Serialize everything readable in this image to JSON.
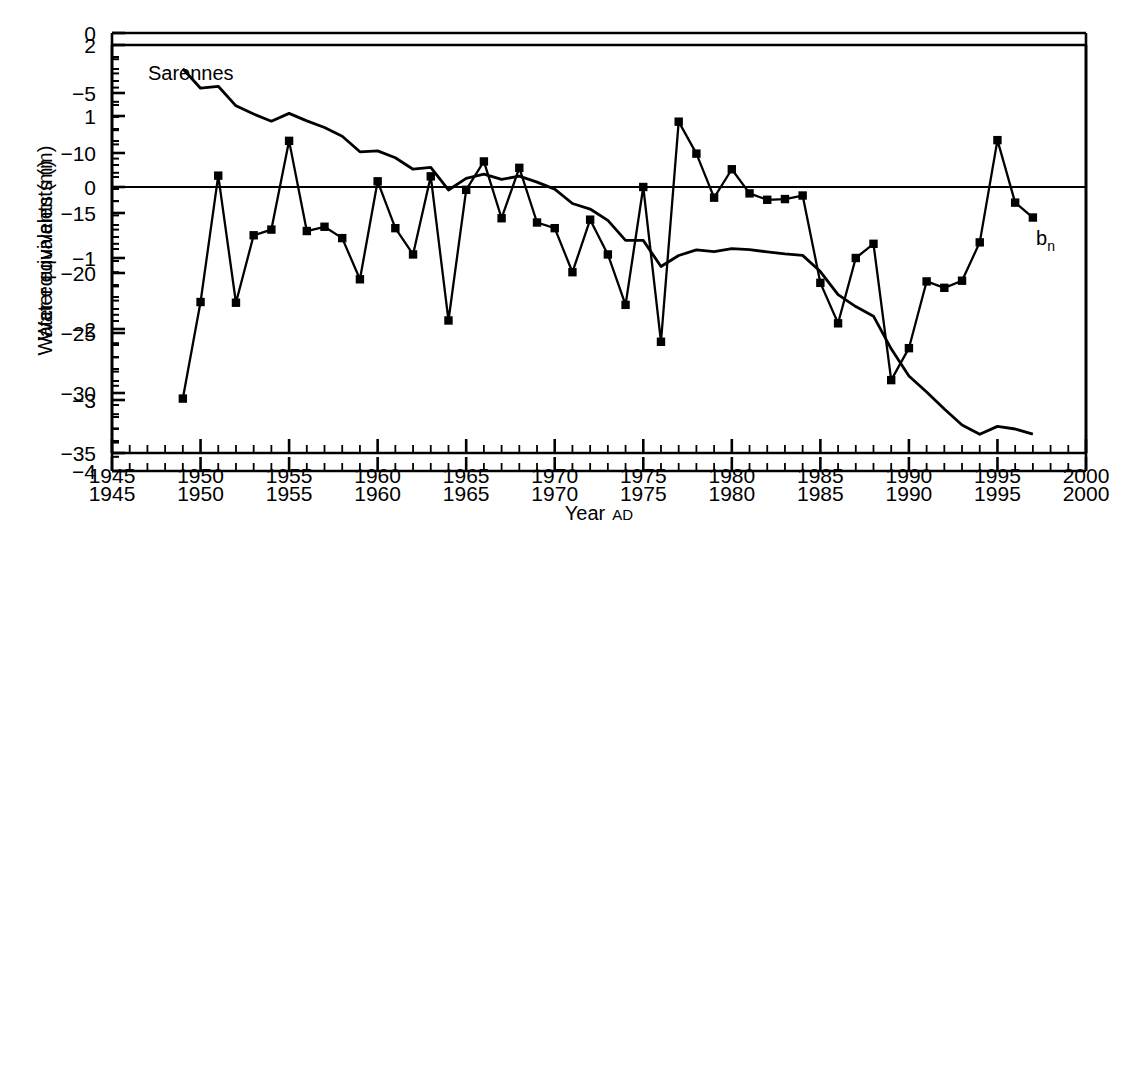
{
  "figure": {
    "background": "#ffffff",
    "line_color": "#000000",
    "marker_color": "#000000"
  },
  "panel_top": {
    "name": "annual-mass-balance-panel",
    "annotation_title": "Sarennes",
    "series_label": "b",
    "series_label_sub": "n",
    "ylabel": "Water equivalents (m)",
    "y_ticks": [
      "2",
      "1",
      "0",
      "-1",
      "-2",
      "-3",
      "-4"
    ],
    "x_ticks": [
      "1945",
      "1950",
      "1955",
      "1960",
      "1965",
      "1970",
      "1975",
      "1980",
      "1985",
      "1990",
      "1995",
      "2000"
    ]
  },
  "panel_bottom": {
    "name": "cumulative-mass-balance-panel",
    "ylabel": "Water equivalents (m)",
    "xlabel": "Year",
    "xlabel_suffix": "AD",
    "y_ticks": [
      "0",
      "-5",
      "-10",
      "-15",
      "-20",
      "-25",
      "-30",
      "-35"
    ],
    "x_ticks": [
      "1945",
      "1950",
      "1955",
      "1960",
      "1965",
      "1970",
      "1975",
      "1980",
      "1985",
      "1990",
      "1995",
      "2000"
    ]
  },
  "chart_data": [
    {
      "type": "line",
      "name": "annual-net-mass-balance",
      "title": "Sarennes",
      "xlabel": "",
      "ylabel": "Water equivalents (m)",
      "xlim": [
        1945,
        2000
      ],
      "ylim": [
        -4,
        2
      ],
      "xticks": [
        1945,
        1950,
        1955,
        1960,
        1965,
        1970,
        1975,
        1980,
        1985,
        1990,
        1995,
        2000
      ],
      "yticks": [
        2,
        1,
        0,
        -1,
        -2,
        -3,
        -4
      ],
      "minor_ticks": true,
      "grid": false,
      "legend": "none",
      "markers": "filled-square",
      "zero_line": true,
      "annotations": [
        {
          "text": "Sarennes",
          "x": 1947.5,
          "y": 1.62
        },
        {
          "text": "b_n",
          "x": 1998.3,
          "y": -0.62
        }
      ],
      "x": [
        1949,
        1950,
        1951,
        1952,
        1953,
        1954,
        1955,
        1956,
        1957,
        1958,
        1959,
        1960,
        1961,
        1962,
        1963,
        1964,
        1965,
        1966,
        1967,
        1968,
        1969,
        1970,
        1971,
        1972,
        1973,
        1974,
        1975,
        1976,
        1977,
        1978,
        1979,
        1980,
        1981,
        1982,
        1983,
        1984,
        1985,
        1986,
        1987,
        1988,
        1989,
        1990,
        1991,
        1992,
        1993,
        1994,
        1995,
        1996,
        1997
      ],
      "values": [
        -2.98,
        -1.62,
        0.16,
        -1.63,
        -0.68,
        -0.6,
        0.65,
        -0.62,
        -0.56,
        -0.72,
        -1.3,
        0.08,
        -0.58,
        -0.95,
        0.15,
        -1.88,
        -0.04,
        0.36,
        -0.44,
        0.27,
        -0.5,
        -0.58,
        -1.2,
        -0.46,
        -0.95,
        -1.66,
        0.0,
        -2.18,
        0.92,
        0.47,
        -0.15,
        0.25,
        -0.09,
        -0.18,
        -0.17,
        -0.12,
        -1.35,
        -1.92,
        -1.0,
        -0.8,
        -2.72,
        -2.27,
        -1.33,
        -1.42,
        -1.32,
        -0.78,
        0.66,
        -0.22,
        -0.43
      ]
    },
    {
      "type": "line",
      "name": "cumulative-net-mass-balance",
      "title": "",
      "xlabel": "Year AD",
      "ylabel": "Water equivalents (m)",
      "xlim": [
        1945,
        2000
      ],
      "ylim": [
        -35,
        0
      ],
      "xticks": [
        1945,
        1950,
        1955,
        1960,
        1965,
        1970,
        1975,
        1980,
        1985,
        1990,
        1995,
        2000
      ],
      "yticks": [
        0,
        -5,
        -10,
        -15,
        -20,
        -25,
        -30,
        -35
      ],
      "minor_ticks": true,
      "grid": false,
      "legend": "none",
      "markers": "none",
      "x": [
        1949,
        1950,
        1951,
        1952,
        1953,
        1954,
        1955,
        1956,
        1957,
        1958,
        1959,
        1960,
        1961,
        1962,
        1963,
        1964,
        1965,
        1966,
        1967,
        1968,
        1969,
        1970,
        1971,
        1972,
        1973,
        1974,
        1975,
        1976,
        1977,
        1978,
        1979,
        1980,
        1981,
        1982,
        1983,
        1984,
        1985,
        1986,
        1987,
        1988,
        1989,
        1990,
        1991,
        1992,
        1993,
        1994,
        1995,
        1996,
        1997
      ],
      "values": [
        -2.98,
        -4.6,
        -4.44,
        -6.07,
        -6.75,
        -7.35,
        -6.7,
        -7.32,
        -7.88,
        -8.6,
        -9.9,
        -9.82,
        -10.4,
        -11.35,
        -11.2,
        -13.08,
        -12.12,
        -11.76,
        -12.2,
        -11.93,
        -12.43,
        -13.01,
        -14.21,
        -14.67,
        -15.62,
        -17.28,
        -17.28,
        -19.46,
        -18.54,
        -18.07,
        -18.22,
        -17.97,
        -18.06,
        -18.24,
        -18.41,
        -18.53,
        -19.88,
        -21.8,
        -22.8,
        -23.6,
        -26.32,
        -28.59,
        -29.92,
        -31.34,
        -32.66,
        -33.44,
        -32.78,
        -33.0,
        -33.43
      ]
    }
  ]
}
